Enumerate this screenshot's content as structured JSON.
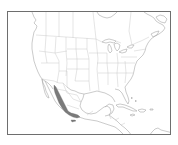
{
  "map": {
    "region": "North America",
    "range_color": "#7a7a7a",
    "outline_color": "#a8a8a8",
    "frame_color": "#6e6e6e",
    "range_description": "Shaded distribution along western Mexico (Sierra Madre Occidental)"
  }
}
